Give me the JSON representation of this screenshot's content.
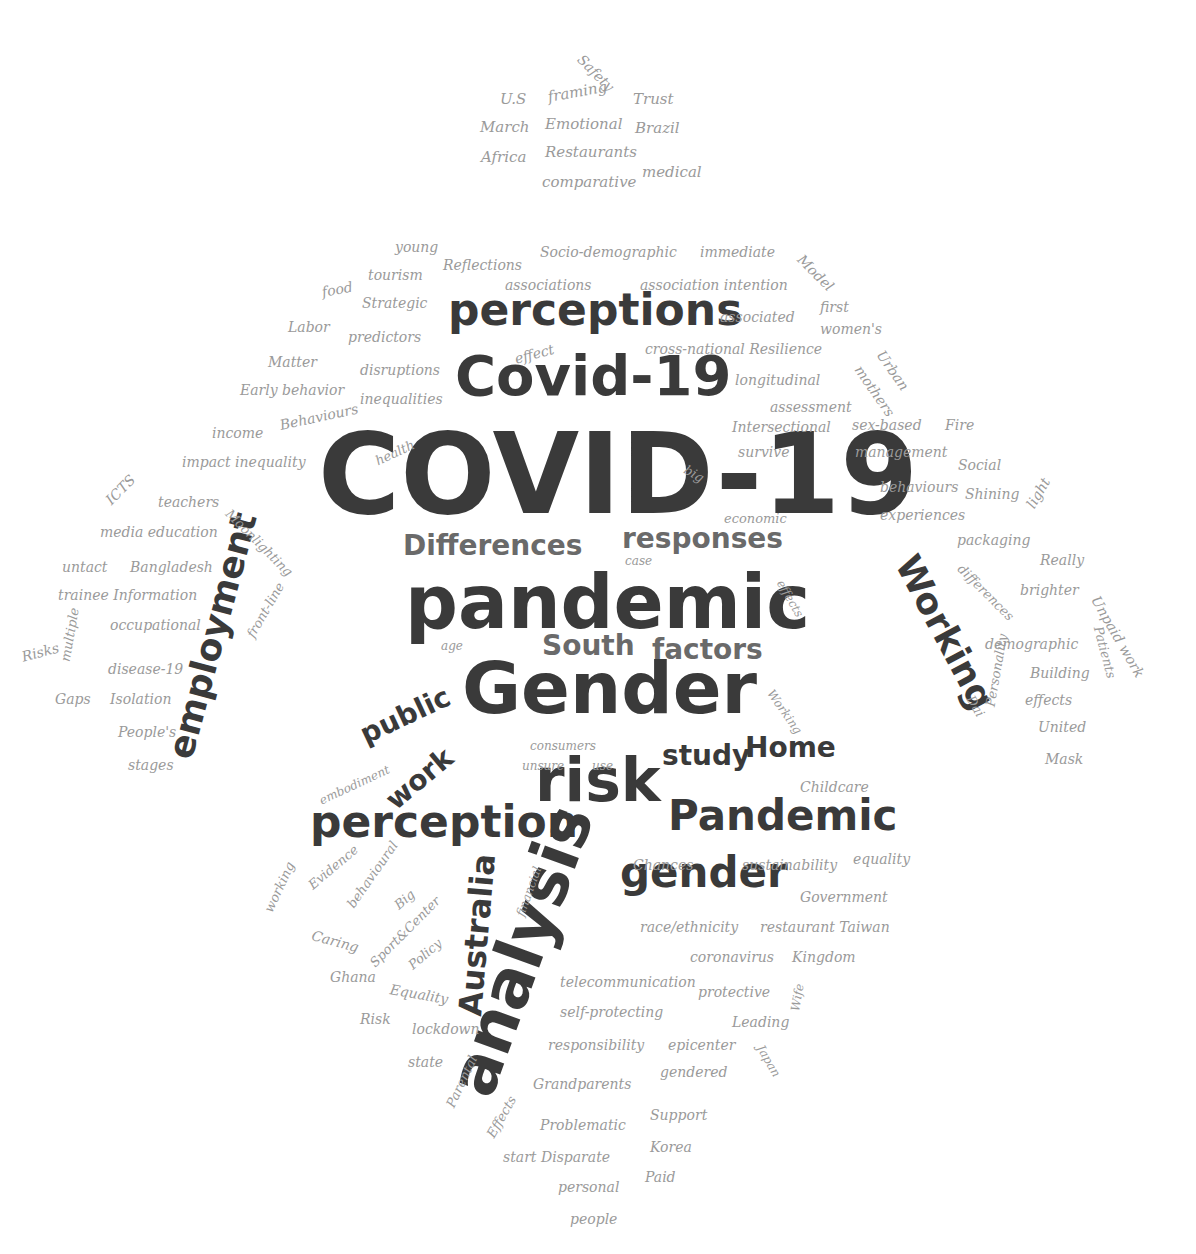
{
  "colors": {
    "background": "#ffffff",
    "dark": "#3a3a3a",
    "mid": "#6a6a6a",
    "light": "#9a9a9a"
  },
  "words": [
    {
      "text": "COVID-19",
      "x": 318,
      "y": 418,
      "size": 112,
      "rot": 0,
      "tone": "dark",
      "big": true
    },
    {
      "text": "pandemic",
      "x": 405,
      "y": 565,
      "size": 74,
      "rot": 0,
      "tone": "dark",
      "big": true
    },
    {
      "text": "Gender",
      "x": 462,
      "y": 652,
      "size": 72,
      "rot": 0,
      "tone": "dark",
      "big": true
    },
    {
      "text": "Covid-19",
      "x": 455,
      "y": 348,
      "size": 56,
      "rot": 0,
      "tone": "dark",
      "big": true
    },
    {
      "text": "perceptions",
      "x": 448,
      "y": 288,
      "size": 44,
      "rot": 0,
      "tone": "dark",
      "big": true
    },
    {
      "text": "perception",
      "x": 310,
      "y": 800,
      "size": 44,
      "rot": 0,
      "tone": "dark",
      "big": true
    },
    {
      "text": "Pandemic",
      "x": 668,
      "y": 795,
      "size": 42,
      "rot": 0,
      "tone": "dark",
      "big": true
    },
    {
      "text": "risk",
      "x": 535,
      "y": 750,
      "size": 60,
      "rot": 0,
      "tone": "dark",
      "big": true
    },
    {
      "text": "analysis",
      "x": 470,
      "y": 1060,
      "size": 66,
      "rot": -70,
      "tone": "dark",
      "big": true
    },
    {
      "text": "gender",
      "x": 620,
      "y": 852,
      "size": 42,
      "rot": 0,
      "tone": "dark",
      "big": true
    },
    {
      "text": "employment",
      "x": 180,
      "y": 740,
      "size": 36,
      "rot": -75,
      "tone": "dark",
      "big": true
    },
    {
      "text": "Working",
      "x": 905,
      "y": 540,
      "size": 36,
      "rot": 62,
      "tone": "dark",
      "big": true
    },
    {
      "text": "Australia",
      "x": 470,
      "y": 1000,
      "size": 32,
      "rot": -85,
      "tone": "dark",
      "big": true
    },
    {
      "text": "Differences",
      "x": 403,
      "y": 532,
      "size": 28,
      "rot": 0,
      "tone": "mid",
      "big": true
    },
    {
      "text": "responses",
      "x": 622,
      "y": 525,
      "size": 28,
      "rot": 0,
      "tone": "mid",
      "big": true
    },
    {
      "text": "South",
      "x": 542,
      "y": 632,
      "size": 28,
      "rot": 0,
      "tone": "mid",
      "big": true
    },
    {
      "text": "factors",
      "x": 652,
      "y": 636,
      "size": 28,
      "rot": 0,
      "tone": "mid",
      "big": true
    },
    {
      "text": "public",
      "x": 362,
      "y": 722,
      "size": 28,
      "rot": -25,
      "tone": "dark",
      "big": true
    },
    {
      "text": "study",
      "x": 662,
      "y": 742,
      "size": 28,
      "rot": 0,
      "tone": "dark",
      "big": true
    },
    {
      "text": "Home",
      "x": 745,
      "y": 734,
      "size": 28,
      "rot": 0,
      "tone": "dark",
      "big": true
    },
    {
      "text": "work",
      "x": 390,
      "y": 790,
      "size": 28,
      "rot": -40,
      "tone": "dark",
      "big": true
    },
    {
      "text": "framing",
      "x": 548,
      "y": 90,
      "size": 15,
      "rot": -10,
      "tone": "light"
    },
    {
      "text": "U.S",
      "x": 500,
      "y": 92,
      "size": 15,
      "rot": 0,
      "tone": "light"
    },
    {
      "text": "Trust",
      "x": 633,
      "y": 92,
      "size": 15,
      "rot": 0,
      "tone": "light"
    },
    {
      "text": "March",
      "x": 480,
      "y": 120,
      "size": 15,
      "rot": 0,
      "tone": "light"
    },
    {
      "text": "Emotional",
      "x": 545,
      "y": 117,
      "size": 15,
      "rot": 0,
      "tone": "light"
    },
    {
      "text": "Brazil",
      "x": 635,
      "y": 121,
      "size": 15,
      "rot": 0,
      "tone": "light"
    },
    {
      "text": "Africa",
      "x": 481,
      "y": 150,
      "size": 15,
      "rot": 0,
      "tone": "light"
    },
    {
      "text": "Restaurants",
      "x": 545,
      "y": 145,
      "size": 15,
      "rot": 0,
      "tone": "light"
    },
    {
      "text": "medical",
      "x": 642,
      "y": 165,
      "size": 15,
      "rot": 0,
      "tone": "light"
    },
    {
      "text": "comparative",
      "x": 542,
      "y": 175,
      "size": 15,
      "rot": 0,
      "tone": "light"
    },
    {
      "text": "Safety",
      "x": 580,
      "y": 50,
      "size": 14,
      "rot": 45,
      "tone": "light"
    },
    {
      "text": "young",
      "x": 395,
      "y": 240,
      "size": 14,
      "rot": 0,
      "tone": "light"
    },
    {
      "text": "tourism",
      "x": 368,
      "y": 268,
      "size": 14,
      "rot": 0,
      "tone": "light"
    },
    {
      "text": "Reflections",
      "x": 443,
      "y": 258,
      "size": 14,
      "rot": 0,
      "tone": "light"
    },
    {
      "text": "food",
      "x": 322,
      "y": 285,
      "size": 14,
      "rot": -10,
      "tone": "light"
    },
    {
      "text": "Strategic",
      "x": 362,
      "y": 296,
      "size": 14,
      "rot": 0,
      "tone": "light"
    },
    {
      "text": "Labor",
      "x": 288,
      "y": 320,
      "size": 14,
      "rot": 0,
      "tone": "light"
    },
    {
      "text": "predictors",
      "x": 348,
      "y": 330,
      "size": 14,
      "rot": 0,
      "tone": "light"
    },
    {
      "text": "Matter",
      "x": 268,
      "y": 355,
      "size": 14,
      "rot": 0,
      "tone": "light"
    },
    {
      "text": "disruptions",
      "x": 360,
      "y": 363,
      "size": 14,
      "rot": 0,
      "tone": "light"
    },
    {
      "text": "Early behavior",
      "x": 240,
      "y": 383,
      "size": 14,
      "rot": 0,
      "tone": "light"
    },
    {
      "text": "inequalities",
      "x": 360,
      "y": 392,
      "size": 14,
      "rot": 0,
      "tone": "light"
    },
    {
      "text": "income",
      "x": 212,
      "y": 426,
      "size": 14,
      "rot": 0,
      "tone": "light"
    },
    {
      "text": "Behaviours",
      "x": 280,
      "y": 418,
      "size": 14,
      "rot": -12,
      "tone": "light"
    },
    {
      "text": "Socio-demographic",
      "x": 540,
      "y": 245,
      "size": 14,
      "rot": 0,
      "tone": "light"
    },
    {
      "text": "immediate",
      "x": 700,
      "y": 245,
      "size": 14,
      "rot": 0,
      "tone": "light"
    },
    {
      "text": "associations",
      "x": 505,
      "y": 278,
      "size": 14,
      "rot": 0,
      "tone": "light"
    },
    {
      "text": "association intention",
      "x": 640,
      "y": 278,
      "size": 14,
      "rot": 0,
      "tone": "light"
    },
    {
      "text": "associated",
      "x": 720,
      "y": 310,
      "size": 14,
      "rot": 0,
      "tone": "light"
    },
    {
      "text": "effect",
      "x": 515,
      "y": 352,
      "size": 14,
      "rot": -15,
      "tone": "light"
    },
    {
      "text": "cross-national Resilience",
      "x": 645,
      "y": 342,
      "size": 14,
      "rot": 0,
      "tone": "light"
    },
    {
      "text": "longitudinal",
      "x": 735,
      "y": 373,
      "size": 14,
      "rot": 0,
      "tone": "light"
    },
    {
      "text": "assessment",
      "x": 770,
      "y": 400,
      "size": 14,
      "rot": 0,
      "tone": "light"
    },
    {
      "text": "Intersectional",
      "x": 732,
      "y": 420,
      "size": 14,
      "rot": 0,
      "tone": "light"
    },
    {
      "text": "survive",
      "x": 738,
      "y": 445,
      "size": 14,
      "rot": 0,
      "tone": "light"
    },
    {
      "text": "Model",
      "x": 800,
      "y": 250,
      "size": 14,
      "rot": 45,
      "tone": "light"
    },
    {
      "text": "first",
      "x": 820,
      "y": 300,
      "size": 14,
      "rot": 0,
      "tone": "light"
    },
    {
      "text": "women's",
      "x": 820,
      "y": 322,
      "size": 14,
      "rot": 0,
      "tone": "light"
    },
    {
      "text": "Urban",
      "x": 880,
      "y": 345,
      "size": 14,
      "rot": 55,
      "tone": "light"
    },
    {
      "text": "mothers",
      "x": 858,
      "y": 360,
      "size": 14,
      "rot": 55,
      "tone": "light"
    },
    {
      "text": "sex-based",
      "x": 852,
      "y": 418,
      "size": 14,
      "rot": 0,
      "tone": "light"
    },
    {
      "text": "Fire",
      "x": 945,
      "y": 418,
      "size": 14,
      "rot": 0,
      "tone": "light"
    },
    {
      "text": "management",
      "x": 855,
      "y": 445,
      "size": 14,
      "rot": 0,
      "tone": "light"
    },
    {
      "text": "Social",
      "x": 958,
      "y": 458,
      "size": 14,
      "rot": 0,
      "tone": "light"
    },
    {
      "text": "behaviours",
      "x": 880,
      "y": 480,
      "size": 14,
      "rot": 0,
      "tone": "light"
    },
    {
      "text": "Shining",
      "x": 965,
      "y": 487,
      "size": 14,
      "rot": 0,
      "tone": "light"
    },
    {
      "text": "light",
      "x": 1030,
      "y": 500,
      "size": 14,
      "rot": -60,
      "tone": "light"
    },
    {
      "text": "experiences",
      "x": 880,
      "y": 508,
      "size": 14,
      "rot": 0,
      "tone": "light"
    },
    {
      "text": "packaging",
      "x": 957,
      "y": 533,
      "size": 14,
      "rot": 0,
      "tone": "light"
    },
    {
      "text": "Really",
      "x": 1040,
      "y": 553,
      "size": 14,
      "rot": 0,
      "tone": "light"
    },
    {
      "text": "differences",
      "x": 960,
      "y": 560,
      "size": 13,
      "rot": 45,
      "tone": "light"
    },
    {
      "text": "brighter",
      "x": 1020,
      "y": 583,
      "size": 14,
      "rot": 0,
      "tone": "light"
    },
    {
      "text": "Unpaid work",
      "x": 1095,
      "y": 590,
      "size": 14,
      "rot": 60,
      "tone": "light"
    },
    {
      "text": "Patients",
      "x": 1098,
      "y": 620,
      "size": 13,
      "rot": 75,
      "tone": "light"
    },
    {
      "text": "demographic",
      "x": 985,
      "y": 637,
      "size": 14,
      "rot": 0,
      "tone": "light"
    },
    {
      "text": "Building",
      "x": 1030,
      "y": 666,
      "size": 14,
      "rot": 0,
      "tone": "light"
    },
    {
      "text": "effects",
      "x": 1025,
      "y": 693,
      "size": 14,
      "rot": 0,
      "tone": "light"
    },
    {
      "text": "Dai",
      "x": 970,
      "y": 690,
      "size": 13,
      "rot": 60,
      "tone": "light"
    },
    {
      "text": "Personality",
      "x": 990,
      "y": 700,
      "size": 13,
      "rot": -80,
      "tone": "light"
    },
    {
      "text": "United",
      "x": 1038,
      "y": 720,
      "size": 14,
      "rot": 0,
      "tone": "light"
    },
    {
      "text": "Mask",
      "x": 1045,
      "y": 752,
      "size": 14,
      "rot": 0,
      "tone": "light"
    },
    {
      "text": "impact inequality",
      "x": 182,
      "y": 455,
      "size": 14,
      "rot": 0,
      "tone": "light"
    },
    {
      "text": "ICTS",
      "x": 108,
      "y": 495,
      "size": 14,
      "rot": -45,
      "tone": "light"
    },
    {
      "text": "teachers",
      "x": 158,
      "y": 495,
      "size": 14,
      "rot": 0,
      "tone": "light"
    },
    {
      "text": "Moonlighting",
      "x": 228,
      "y": 505,
      "size": 13,
      "rot": 45,
      "tone": "light"
    },
    {
      "text": "media education",
      "x": 100,
      "y": 525,
      "size": 14,
      "rot": 0,
      "tone": "light"
    },
    {
      "text": "untact",
      "x": 62,
      "y": 560,
      "size": 14,
      "rot": 0,
      "tone": "light"
    },
    {
      "text": "Bangladesh",
      "x": 130,
      "y": 560,
      "size": 14,
      "rot": 0,
      "tone": "light"
    },
    {
      "text": "trainee Information",
      "x": 58,
      "y": 588,
      "size": 14,
      "rot": 0,
      "tone": "light"
    },
    {
      "text": "occupational",
      "x": 110,
      "y": 618,
      "size": 14,
      "rot": 0,
      "tone": "light"
    },
    {
      "text": "front-line",
      "x": 250,
      "y": 630,
      "size": 13,
      "rot": -60,
      "tone": "light"
    },
    {
      "text": "Risks",
      "x": 22,
      "y": 650,
      "size": 14,
      "rot": -15,
      "tone": "light"
    },
    {
      "text": "multiple",
      "x": 65,
      "y": 655,
      "size": 13,
      "rot": -80,
      "tone": "light"
    },
    {
      "text": "disease-19",
      "x": 108,
      "y": 662,
      "size": 14,
      "rot": 0,
      "tone": "light"
    },
    {
      "text": "Gaps",
      "x": 55,
      "y": 692,
      "size": 14,
      "rot": 0,
      "tone": "light"
    },
    {
      "text": "Isolation",
      "x": 110,
      "y": 692,
      "size": 14,
      "rot": 0,
      "tone": "light"
    },
    {
      "text": "People's",
      "x": 118,
      "y": 725,
      "size": 14,
      "rot": 0,
      "tone": "light"
    },
    {
      "text": "stages",
      "x": 128,
      "y": 758,
      "size": 14,
      "rot": 0,
      "tone": "light"
    },
    {
      "text": "health",
      "x": 376,
      "y": 455,
      "size": 13,
      "rot": -25,
      "tone": "light"
    },
    {
      "text": "big",
      "x": 685,
      "y": 462,
      "size": 13,
      "rot": 30,
      "tone": "light"
    },
    {
      "text": "economic",
      "x": 724,
      "y": 512,
      "size": 13,
      "rot": 0,
      "tone": "light"
    },
    {
      "text": "case",
      "x": 625,
      "y": 555,
      "size": 12,
      "rot": 0,
      "tone": "light"
    },
    {
      "text": "effects",
      "x": 780,
      "y": 575,
      "size": 12,
      "rot": 60,
      "tone": "light"
    },
    {
      "text": "age",
      "x": 441,
      "y": 640,
      "size": 12,
      "rot": 0,
      "tone": "light"
    },
    {
      "text": "Working",
      "x": 770,
      "y": 685,
      "size": 12,
      "rot": 55,
      "tone": "light"
    },
    {
      "text": "consumers",
      "x": 530,
      "y": 740,
      "size": 12,
      "rot": 0,
      "tone": "light"
    },
    {
      "text": "unsure",
      "x": 522,
      "y": 760,
      "size": 12,
      "rot": 0,
      "tone": "light"
    },
    {
      "text": "use",
      "x": 592,
      "y": 760,
      "size": 12,
      "rot": 0,
      "tone": "light"
    },
    {
      "text": "embodiment",
      "x": 320,
      "y": 795,
      "size": 12,
      "rot": -25,
      "tone": "light"
    },
    {
      "text": "Childcare",
      "x": 800,
      "y": 780,
      "size": 14,
      "rot": 0,
      "tone": "light"
    },
    {
      "text": "working",
      "x": 268,
      "y": 905,
      "size": 13,
      "rot": -65,
      "tone": "light"
    },
    {
      "text": "Evidence",
      "x": 310,
      "y": 880,
      "size": 13,
      "rot": -40,
      "tone": "light"
    },
    {
      "text": "behavioural",
      "x": 350,
      "y": 900,
      "size": 13,
      "rot": -55,
      "tone": "light"
    },
    {
      "text": "Big",
      "x": 396,
      "y": 900,
      "size": 13,
      "rot": -40,
      "tone": "light"
    },
    {
      "text": "Caring",
      "x": 312,
      "y": 928,
      "size": 14,
      "rot": 15,
      "tone": "light"
    },
    {
      "text": "Sport&Center",
      "x": 372,
      "y": 958,
      "size": 13,
      "rot": -45,
      "tone": "light"
    },
    {
      "text": "Policy",
      "x": 410,
      "y": 960,
      "size": 13,
      "rot": -40,
      "tone": "light"
    },
    {
      "text": "Ghana",
      "x": 330,
      "y": 970,
      "size": 14,
      "rot": 0,
      "tone": "light"
    },
    {
      "text": "Equality",
      "x": 390,
      "y": 982,
      "size": 14,
      "rot": 10,
      "tone": "light"
    },
    {
      "text": "Risk",
      "x": 360,
      "y": 1012,
      "size": 14,
      "rot": 0,
      "tone": "light"
    },
    {
      "text": "lockdown",
      "x": 412,
      "y": 1022,
      "size": 14,
      "rot": 0,
      "tone": "light"
    },
    {
      "text": "state",
      "x": 408,
      "y": 1055,
      "size": 14,
      "rot": 0,
      "tone": "light"
    },
    {
      "text": "Parental",
      "x": 450,
      "y": 1100,
      "size": 13,
      "rot": -65,
      "tone": "light"
    },
    {
      "text": "Effects",
      "x": 490,
      "y": 1130,
      "size": 13,
      "rot": -60,
      "tone": "light"
    },
    {
      "text": "financial",
      "x": 520,
      "y": 910,
      "size": 12,
      "rot": -70,
      "tone": "light"
    },
    {
      "text": "Chances",
      "x": 633,
      "y": 858,
      "size": 14,
      "rot": 0,
      "tone": "light"
    },
    {
      "text": "sustainability",
      "x": 742,
      "y": 858,
      "size": 14,
      "rot": 0,
      "tone": "light"
    },
    {
      "text": "equality",
      "x": 853,
      "y": 852,
      "size": 14,
      "rot": 0,
      "tone": "light"
    },
    {
      "text": "Government",
      "x": 800,
      "y": 890,
      "size": 14,
      "rot": 0,
      "tone": "light"
    },
    {
      "text": "race/ethnicity",
      "x": 640,
      "y": 920,
      "size": 14,
      "rot": 0,
      "tone": "light"
    },
    {
      "text": "restaurant Taiwan",
      "x": 760,
      "y": 920,
      "size": 14,
      "rot": 0,
      "tone": "light"
    },
    {
      "text": "coronavirus",
      "x": 690,
      "y": 950,
      "size": 14,
      "rot": 0,
      "tone": "light"
    },
    {
      "text": "Kingdom",
      "x": 792,
      "y": 950,
      "size": 14,
      "rot": 0,
      "tone": "light"
    },
    {
      "text": "telecommunication",
      "x": 560,
      "y": 975,
      "size": 14,
      "rot": 0,
      "tone": "light"
    },
    {
      "text": "protective",
      "x": 698,
      "y": 985,
      "size": 14,
      "rot": 0,
      "tone": "light"
    },
    {
      "text": "self-protecting",
      "x": 560,
      "y": 1005,
      "size": 14,
      "rot": 0,
      "tone": "light"
    },
    {
      "text": "Leading",
      "x": 732,
      "y": 1015,
      "size": 14,
      "rot": 0,
      "tone": "light"
    },
    {
      "text": "Wife",
      "x": 795,
      "y": 1005,
      "size": 12,
      "rot": -80,
      "tone": "light"
    },
    {
      "text": "responsibility",
      "x": 548,
      "y": 1038,
      "size": 14,
      "rot": 0,
      "tone": "light"
    },
    {
      "text": "epicenter",
      "x": 668,
      "y": 1038,
      "size": 14,
      "rot": 0,
      "tone": "light"
    },
    {
      "text": "Japan",
      "x": 760,
      "y": 1040,
      "size": 12,
      "rot": 60,
      "tone": "light"
    },
    {
      "text": "gendered",
      "x": 660,
      "y": 1065,
      "size": 14,
      "rot": 0,
      "tone": "light"
    },
    {
      "text": "Grandparents",
      "x": 533,
      "y": 1077,
      "size": 14,
      "rot": 0,
      "tone": "light"
    },
    {
      "text": "Support",
      "x": 650,
      "y": 1108,
      "size": 14,
      "rot": 0,
      "tone": "light"
    },
    {
      "text": "Problematic",
      "x": 540,
      "y": 1118,
      "size": 14,
      "rot": 0,
      "tone": "light"
    },
    {
      "text": "Korea",
      "x": 650,
      "y": 1140,
      "size": 14,
      "rot": 0,
      "tone": "light"
    },
    {
      "text": "start Disparate",
      "x": 503,
      "y": 1150,
      "size": 14,
      "rot": 0,
      "tone": "light"
    },
    {
      "text": "Paid",
      "x": 645,
      "y": 1170,
      "size": 14,
      "rot": 0,
      "tone": "light"
    },
    {
      "text": "personal",
      "x": 558,
      "y": 1180,
      "size": 14,
      "rot": 0,
      "tone": "light"
    },
    {
      "text": "people",
      "x": 570,
      "y": 1212,
      "size": 14,
      "rot": 0,
      "tone": "light"
    }
  ]
}
